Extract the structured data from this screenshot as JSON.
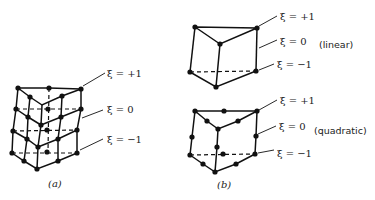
{
  "figure_a": {
    "caption": "(a)",
    "labels": {
      "top": "ξ = +1",
      "mid": "ξ = 0",
      "bottom": "ξ = −1"
    }
  },
  "figure_b": {
    "caption": "(b)",
    "linear": {
      "type_label": "(linear)",
      "labels": {
        "top": "ξ = +1",
        "mid": "ξ = 0",
        "bottom": "ξ = −1"
      }
    },
    "quadratic": {
      "type_label": "(quadratic)",
      "labels": {
        "top": "ξ = +1",
        "mid": "ξ = 0",
        "bottom": "ξ = −1"
      }
    }
  }
}
